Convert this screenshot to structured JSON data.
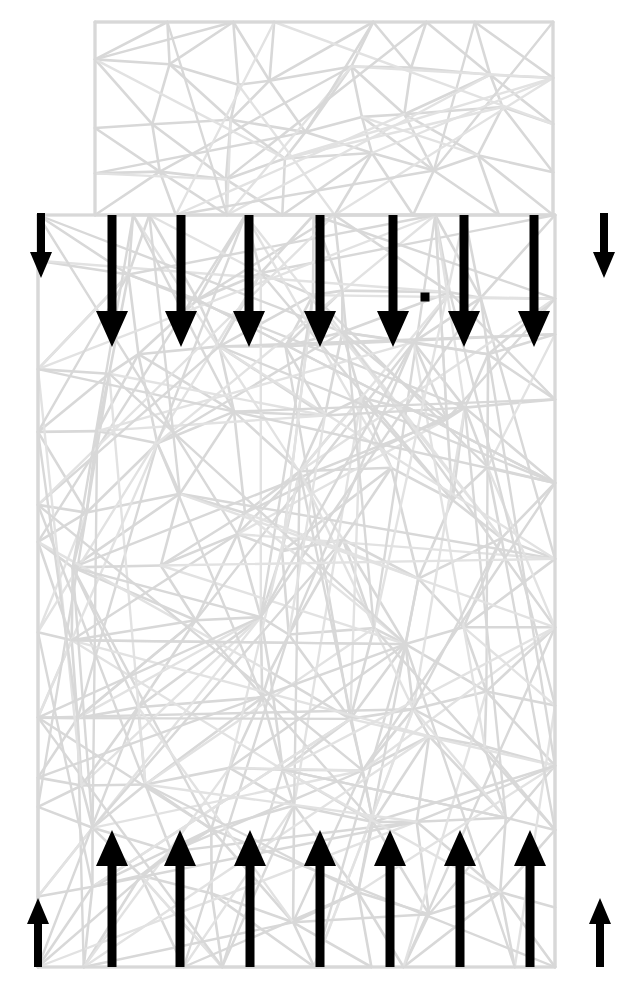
{
  "figure": {
    "type": "fem-mesh-load-diagram",
    "canvas": {
      "width": 642,
      "height": 998,
      "background": "#ffffff"
    },
    "colors": {
      "mesh_line": "#d8d8d8",
      "mesh_line_light": "#e2e2e2",
      "arrow": "#000000",
      "background": "#ffffff"
    },
    "geometry": {
      "upper_block": {
        "x": 95,
        "y": 22,
        "width": 458,
        "height": 193,
        "label": "upper-narrow-block"
      },
      "lower_block": {
        "x": 38,
        "y": 215,
        "width": 517,
        "height": 752,
        "label": "lower-wide-block"
      },
      "step_line_y": 215,
      "base_line_y": 967
    },
    "marker": {
      "name": "node-marker",
      "x": 425,
      "y": 297,
      "size": 9
    }
  },
  "loads": {
    "top": {
      "name": "top-traction-row",
      "direction": "down",
      "count": 10,
      "arrows": [
        {
          "x": 41,
          "y_start": 213,
          "y_end": 278,
          "shaft_width": 8,
          "head_width": 22,
          "head_length": 26,
          "size": "short"
        },
        {
          "x": 112,
          "y_start": 215,
          "y_end": 347,
          "shaft_width": 9,
          "head_width": 32,
          "head_length": 36,
          "size": "long"
        },
        {
          "x": 181,
          "y_start": 215,
          "y_end": 347,
          "shaft_width": 9,
          "head_width": 32,
          "head_length": 36,
          "size": "long"
        },
        {
          "x": 249,
          "y_start": 215,
          "y_end": 347,
          "shaft_width": 9,
          "head_width": 32,
          "head_length": 36,
          "size": "long"
        },
        {
          "x": 320,
          "y_start": 215,
          "y_end": 347,
          "shaft_width": 9,
          "head_width": 32,
          "head_length": 36,
          "size": "long"
        },
        {
          "x": 393,
          "y_start": 215,
          "y_end": 347,
          "shaft_width": 9,
          "head_width": 32,
          "head_length": 36,
          "size": "long"
        },
        {
          "x": 464,
          "y_start": 215,
          "y_end": 347,
          "shaft_width": 9,
          "head_width": 32,
          "head_length": 36,
          "size": "long"
        },
        {
          "x": 534,
          "y_start": 215,
          "y_end": 347,
          "shaft_width": 9,
          "head_width": 32,
          "head_length": 36,
          "size": "long"
        },
        {
          "x": 604,
          "y_start": 213,
          "y_end": 278,
          "shaft_width": 8,
          "head_width": 22,
          "head_length": 26,
          "size": "short"
        }
      ]
    },
    "bottom": {
      "name": "bottom-reaction-row",
      "direction": "up",
      "count": 9,
      "arrows": [
        {
          "x": 38,
          "y_start": 967,
          "y_end": 898,
          "shaft_width": 8,
          "head_width": 22,
          "head_length": 26,
          "size": "short"
        },
        {
          "x": 112,
          "y_start": 967,
          "y_end": 830,
          "shaft_width": 9,
          "head_width": 32,
          "head_length": 36,
          "size": "long"
        },
        {
          "x": 180,
          "y_start": 967,
          "y_end": 830,
          "shaft_width": 9,
          "head_width": 32,
          "head_length": 36,
          "size": "long"
        },
        {
          "x": 250,
          "y_start": 967,
          "y_end": 830,
          "shaft_width": 9,
          "head_width": 32,
          "head_length": 36,
          "size": "long"
        },
        {
          "x": 320,
          "y_start": 967,
          "y_end": 830,
          "shaft_width": 9,
          "head_width": 32,
          "head_length": 36,
          "size": "long"
        },
        {
          "x": 390,
          "y_start": 967,
          "y_end": 830,
          "shaft_width": 9,
          "head_width": 32,
          "head_length": 36,
          "size": "long"
        },
        {
          "x": 460,
          "y_start": 967,
          "y_end": 830,
          "shaft_width": 9,
          "head_width": 32,
          "head_length": 36,
          "size": "long"
        },
        {
          "x": 530,
          "y_start": 967,
          "y_end": 830,
          "shaft_width": 9,
          "head_width": 32,
          "head_length": 36,
          "size": "long"
        },
        {
          "x": 600,
          "y_start": 967,
          "y_end": 898,
          "shaft_width": 8,
          "head_width": 22,
          "head_length": 26,
          "size": "short"
        }
      ]
    }
  },
  "chart_data": {
    "type": "diagram",
    "mesh": {
      "edge_color": "#d8d8d8",
      "upper_region_nodes": [
        [
          95,
          22
        ],
        [
          170,
          22
        ],
        [
          248,
          22
        ],
        [
          330,
          22
        ],
        [
          420,
          22
        ],
        [
          480,
          22
        ],
        [
          553,
          22
        ],
        [
          95,
          78
        ],
        [
          136,
          64
        ],
        [
          205,
          60
        ],
        [
          280,
          52
        ],
        [
          352,
          70
        ],
        [
          420,
          56
        ],
        [
          495,
          60
        ],
        [
          553,
          80
        ],
        [
          95,
          135
        ],
        [
          150,
          118
        ],
        [
          236,
          100
        ],
        [
          300,
          122
        ],
        [
          380,
          110
        ],
        [
          450,
          100
        ],
        [
          520,
          128
        ],
        [
          553,
          140
        ],
        [
          95,
          180
        ],
        [
          160,
          160
        ],
        [
          240,
          148
        ],
        [
          318,
          168
        ],
        [
          398,
          150
        ],
        [
          470,
          170
        ],
        [
          553,
          188
        ],
        [
          95,
          215
        ],
        [
          175,
          200
        ],
        [
          255,
          208
        ],
        [
          338,
          196
        ],
        [
          415,
          206
        ],
        [
          490,
          200
        ],
        [
          553,
          215
        ]
      ],
      "lower_region_nodes": [
        [
          38,
          215
        ],
        [
          110,
          215
        ],
        [
          190,
          215
        ],
        [
          270,
          215
        ],
        [
          350,
          215
        ],
        [
          430,
          215
        ],
        [
          500,
          215
        ],
        [
          555,
          215
        ],
        [
          38,
          290
        ],
        [
          100,
          262
        ],
        [
          175,
          300
        ],
        [
          255,
          270
        ],
        [
          330,
          310
        ],
        [
          405,
          280
        ],
        [
          480,
          300
        ],
        [
          555,
          275
        ],
        [
          38,
          360
        ],
        [
          95,
          400
        ],
        [
          180,
          345
        ],
        [
          260,
          390
        ],
        [
          340,
          350
        ],
        [
          420,
          400
        ],
        [
          495,
          360
        ],
        [
          555,
          395
        ],
        [
          38,
          450
        ],
        [
          120,
          470
        ],
        [
          200,
          430
        ],
        [
          285,
          480
        ],
        [
          360,
          440
        ],
        [
          440,
          470
        ],
        [
          520,
          440
        ],
        [
          555,
          480
        ],
        [
          38,
          530
        ],
        [
          105,
          560
        ],
        [
          190,
          520
        ],
        [
          270,
          570
        ],
        [
          350,
          530
        ],
        [
          430,
          560
        ],
        [
          500,
          525
        ],
        [
          555,
          560
        ],
        [
          38,
          620
        ],
        [
          130,
          650
        ],
        [
          210,
          610
        ],
        [
          290,
          660
        ],
        [
          365,
          620
        ],
        [
          445,
          655
        ],
        [
          525,
          615
        ],
        [
          555,
          650
        ],
        [
          38,
          710
        ],
        [
          110,
          740
        ],
        [
          195,
          700
        ],
        [
          275,
          750
        ],
        [
          355,
          705
        ],
        [
          435,
          745
        ],
        [
          510,
          710
        ],
        [
          555,
          740
        ],
        [
          38,
          800
        ],
        [
          120,
          830
        ],
        [
          200,
          790
        ],
        [
          285,
          840
        ],
        [
          360,
          800
        ],
        [
          440,
          835
        ],
        [
          520,
          795
        ],
        [
          555,
          830
        ],
        [
          38,
          890
        ],
        [
          105,
          910
        ],
        [
          185,
          875
        ],
        [
          265,
          920
        ],
        [
          345,
          885
        ],
        [
          425,
          915
        ],
        [
          505,
          880
        ],
        [
          555,
          910
        ],
        [
          38,
          967
        ],
        [
          110,
          967
        ],
        [
          190,
          967
        ],
        [
          270,
          967
        ],
        [
          350,
          967
        ],
        [
          430,
          967
        ],
        [
          500,
          967
        ],
        [
          555,
          967
        ]
      ]
    },
    "loads_summary": {
      "top_arrow_count": 9,
      "bottom_arrow_count": 9,
      "top_direction": "downward (compression)",
      "bottom_direction": "upward (reaction)"
    }
  }
}
